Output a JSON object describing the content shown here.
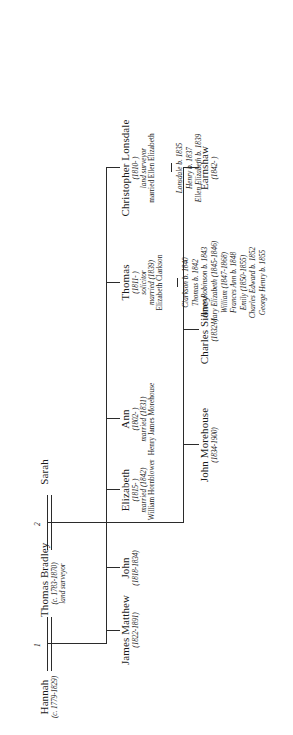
{
  "document": {
    "type": "genealogical-family-tree",
    "orientation": "rotated-90-ccw",
    "line_color": "#2b2b2b",
    "text_color": "#1a1a1a"
  },
  "generation1": {
    "spouse1": {
      "name": "Hannah",
      "dates": "(c. 1779-1829)"
    },
    "center": {
      "name": "Thomas Bradley",
      "dates": "(c. 1783-1870)",
      "occupation": "land surveyor"
    },
    "spouse2": {
      "name": "Sarah",
      "dates": ""
    },
    "marriage_markers": {
      "first": "1",
      "second": "2"
    }
  },
  "generation2": [
    {
      "name": "Christopher Lonsdale",
      "dates": "(1810- )",
      "occupation": "land surveyor",
      "marriage": "married Ellen Elizabeth",
      "children": [
        "Lonsdale b. 1835",
        "Henry b. 1837",
        "Ellen Elizabeth b. 1839"
      ]
    },
    {
      "name": "Thomas",
      "dates": "(1811- )",
      "occupation": "solicitor",
      "marriage": "married (1839)",
      "marriage_spouse": "Elizabeth Clarkson",
      "children": [
        "Clarkson b. 1840",
        "Thomas b. 1842",
        "James Robinson b. 1843",
        "Mary Elizabeth (1845-1846)",
        "William (1847-1868)",
        "Frances Ann b. 1848",
        "Emily (1850-1855)",
        "Charles Edward b. 1852",
        "George Henry b. 1855"
      ]
    },
    {
      "name": "Ann",
      "dates": "(1802- )",
      "occupation": "",
      "marriage": "married (1831)",
      "marriage_spouse": "Henry James Morehouse",
      "children": []
    },
    {
      "name": "Elizabeth",
      "dates": "(1815- )",
      "occupation": "",
      "marriage": "married (1842)",
      "marriage_spouse": "William Hornblower",
      "children": []
    },
    {
      "name": "John",
      "dates": "(1818-1834)",
      "occupation": "",
      "marriage": "",
      "children": []
    },
    {
      "name": "James Matthew",
      "dates": "(1822-1891)",
      "occupation": "",
      "marriage": "",
      "children": []
    }
  ],
  "generation3": [
    {
      "name": "Charles Sidney",
      "dates": "(1832- )",
      "parent": "Ann"
    },
    {
      "name": "John Morehouse",
      "dates": "(1834-1900)",
      "parent": "Ann"
    },
    {
      "name": "Earnshaw",
      "dates": "(1842- )",
      "parent": "Ann"
    }
  ]
}
